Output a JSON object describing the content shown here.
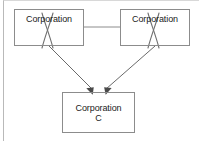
{
  "diagram": {
    "background_color": "#ffffff",
    "line_color": "#8c8c8c",
    "text_color": "#1a1a1a",
    "frame_color": "#b9b9b9",
    "nodes": [
      {
        "id": "box-a",
        "label": "Corporation",
        "struck_out": true,
        "strike_mark": "X",
        "position": "top-left"
      },
      {
        "id": "box-b",
        "label": "Corporation",
        "struck_out": true,
        "strike_mark": "X",
        "position": "top-right"
      },
      {
        "id": "box-c",
        "label": "Corporation\nC",
        "struck_out": false,
        "strike_mark": "",
        "position": "bottom-center"
      }
    ],
    "connectors": [
      {
        "id": "connector-a-b",
        "from": "box-a",
        "to": "box-b",
        "style": "plain-line",
        "arrowhead": "none"
      },
      {
        "id": "arrow-a-c",
        "from": "box-a",
        "to": "box-c",
        "style": "diagonal-line",
        "arrowhead": "filled"
      },
      {
        "id": "arrow-b-c",
        "from": "box-b",
        "to": "box-c",
        "style": "diagonal-line",
        "arrowhead": "filled"
      }
    ]
  }
}
